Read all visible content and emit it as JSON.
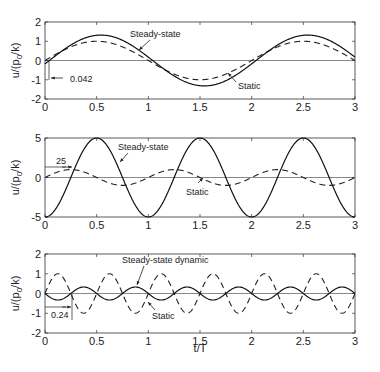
{
  "chart_data": [
    {
      "type": "line",
      "title": "",
      "xlabel": "",
      "ylabel": "u/(p0/k)",
      "xlim": [
        0,
        3
      ],
      "ylim": [
        -2,
        2
      ],
      "xticks": [
        "0",
        "0.5",
        "1",
        "1.5",
        "2",
        "2.5",
        "3"
      ],
      "yticks": [
        "2",
        "1",
        "0",
        "-1",
        "-2"
      ],
      "grid": false,
      "series": [
        {
          "name": "Steady-state",
          "style": "solid",
          "amplitude": 1.32,
          "period": 2,
          "phase_lag": 0.042,
          "note": "u = 1.32 sin(pi t/T - lag)"
        },
        {
          "name": "Static",
          "style": "dashed",
          "amplitude": 1.0,
          "period": 2,
          "phase_lag": 0,
          "note": "u = sin(pi t/T)"
        }
      ],
      "annotations": [
        {
          "text": "Steady-state",
          "x": 1.1,
          "y": 1.5
        },
        {
          "text": "Static",
          "x": 1.95,
          "y": -0.9
        },
        {
          "text": "0.042",
          "x": 0.2,
          "y": -0.85
        }
      ]
    },
    {
      "type": "line",
      "title": "",
      "xlabel": "",
      "ylabel": "u/(p0/k)",
      "xlim": [
        0,
        3
      ],
      "ylim": [
        -5,
        5
      ],
      "xticks": [
        "0",
        "0.5",
        "1",
        "1.5",
        "2",
        "2.5",
        "3"
      ],
      "yticks": [
        "5",
        "0",
        "-5"
      ],
      "grid": false,
      "series": [
        {
          "name": "Steady-state",
          "style": "solid",
          "amplitude": 5.0,
          "period": 1,
          "phase_lag": 0.25,
          "note": "u = -5 cos(2 pi t/T)"
        },
        {
          "name": "Static",
          "style": "dashed",
          "amplitude": 1.0,
          "period": 1,
          "phase_lag": 0,
          "note": "u = sin(2 pi t/T)"
        }
      ],
      "annotations": [
        {
          "text": "Steady-state",
          "x": 0.75,
          "y": 3.6
        },
        {
          "text": "Static",
          "x": 1.4,
          "y": -2.0
        },
        {
          "text": "25",
          "x": 0.08,
          "y": 2.1
        }
      ]
    },
    {
      "type": "line",
      "title": "",
      "xlabel": "t/T",
      "ylabel": "u/(p0/k)",
      "xlim": [
        0,
        3
      ],
      "ylim": [
        -2,
        2
      ],
      "xticks": [
        "0",
        "0.5",
        "1",
        "1.5",
        "2",
        "2.5",
        "3"
      ],
      "yticks": [
        "2",
        "1",
        "0",
        "-1",
        "-2"
      ],
      "grid": false,
      "series": [
        {
          "name": "Steady-state dynamic",
          "style": "solid",
          "amplitude": 0.33,
          "period": 0.5,
          "phase_lag": 0.24,
          "note": "u = -0.33 sin(4 pi t/T)"
        },
        {
          "name": "Static",
          "style": "dashed",
          "amplitude": 1.0,
          "period": 0.5,
          "phase_lag": 0,
          "note": "u = sin(4 pi t/T)"
        }
      ],
      "annotations": [
        {
          "text": "Steady-state dynamic",
          "x": 1.0,
          "y": 1.45
        },
        {
          "text": "Static",
          "x": 1.05,
          "y": -1.15
        },
        {
          "text": "0.24",
          "x": 0.1,
          "y": -1.1
        }
      ]
    }
  ],
  "labels": {
    "ylabel_main": "u/(p",
    "ylabel_sub": "0",
    "ylabel_tail": "/k)",
    "xlabel": "t/T",
    "p1_steady": "Steady-state",
    "p1_static": "Static",
    "p1_lag": "0.042",
    "p2_steady": "Steady-state",
    "p2_static": "Static",
    "p2_lag": "25",
    "p3_steady": "Steady-state dynamic",
    "p3_static": "Static",
    "p3_lag": "0.24"
  },
  "ticks": {
    "x": [
      "0",
      "0.5",
      "1",
      "1.5",
      "2",
      "2.5",
      "3"
    ],
    "y1": [
      "2",
      "1",
      "0",
      "-1",
      "-2"
    ],
    "y2": [
      "5",
      "0",
      "-5"
    ],
    "y3": [
      "2",
      "1",
      "0",
      "-1",
      "-2"
    ]
  }
}
